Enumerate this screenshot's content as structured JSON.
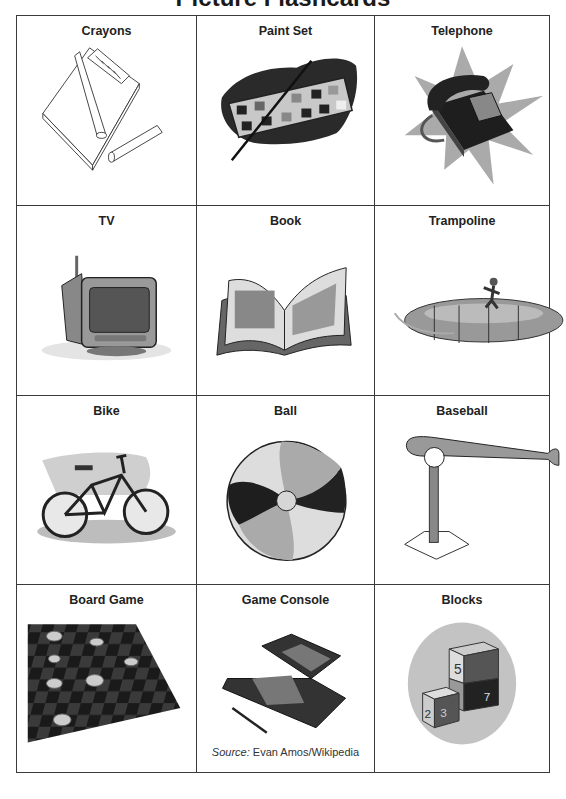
{
  "title": "Picture Flashcards",
  "cards": [
    {
      "label": "Crayons",
      "icon": "crayons-icon"
    },
    {
      "label": "Paint Set",
      "icon": "paint-set-icon"
    },
    {
      "label": "Telephone",
      "icon": "telephone-icon"
    },
    {
      "label": "TV",
      "icon": "tv-icon"
    },
    {
      "label": "Book",
      "icon": "book-icon"
    },
    {
      "label": "Trampoline",
      "icon": "trampoline-icon"
    },
    {
      "label": "Bike",
      "icon": "bike-icon"
    },
    {
      "label": "Ball",
      "icon": "beach-ball-icon"
    },
    {
      "label": "Baseball",
      "icon": "baseball-tee-icon"
    },
    {
      "label": "Board Game",
      "icon": "checkerboard-icon"
    },
    {
      "label": "Game Console",
      "icon": "handheld-console-icon"
    },
    {
      "label": "Blocks",
      "icon": "toy-blocks-icon"
    }
  ],
  "source": {
    "prefix": "Source:",
    "text": " Evan Amos/Wikipedia"
  },
  "blocks_numbers": [
    "5",
    "1",
    "0",
    "7",
    "1",
    "2",
    "3"
  ]
}
